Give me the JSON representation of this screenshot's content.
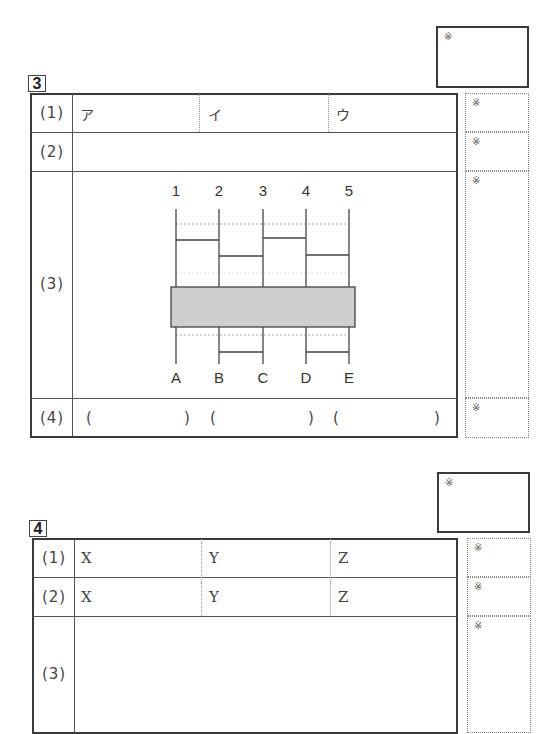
{
  "score_mark": "※",
  "section3": {
    "number": "3",
    "rows": [
      {
        "label": "(1)",
        "cells": [
          "ア",
          "イ",
          "ウ"
        ]
      },
      {
        "label": "(2)",
        "cells": []
      },
      {
        "label": "(3)",
        "cells": []
      },
      {
        "label": "(4)",
        "cells": [
          "(",
          ")",
          "(",
          ")",
          "(",
          ")"
        ]
      }
    ],
    "diagram": {
      "top_labels": [
        "1",
        "2",
        "3",
        "4",
        "5"
      ],
      "bottom_labels": [
        "A",
        "B",
        "C",
        "D",
        "E"
      ],
      "box_color": "#cfcfcf"
    }
  },
  "section4": {
    "number": "4",
    "rows": [
      {
        "label": "(1)",
        "cells": [
          "X",
          "Y",
          "Z"
        ]
      },
      {
        "label": "(2)",
        "cells": [
          "X",
          "Y",
          "Z"
        ]
      },
      {
        "label": "(3)",
        "cells": []
      }
    ]
  }
}
